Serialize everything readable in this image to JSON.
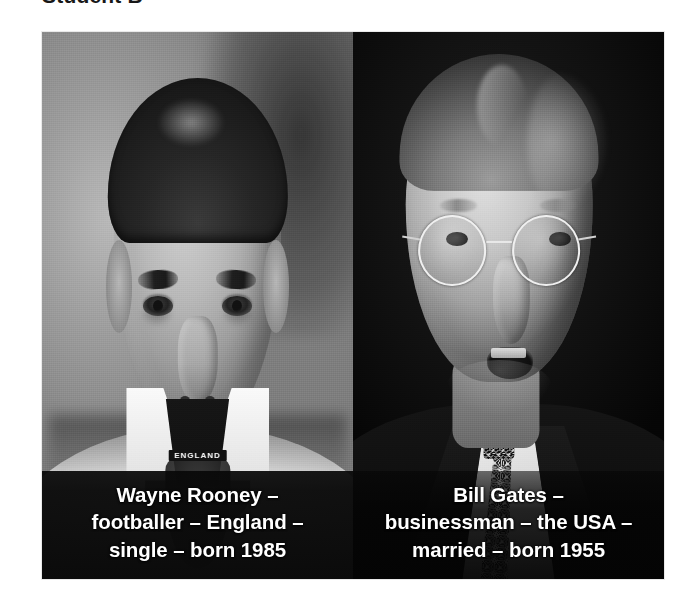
{
  "page": {
    "title": "Student B",
    "background_color": "#ffffff"
  },
  "photos": [
    {
      "id": "wayne-rooney",
      "subject": "Wayne Rooney",
      "description": "Black and white head-and-shoulders photograph of a young male footballer wearing a white England shirt with a dark collar.",
      "collar_label": "ENGLAND",
      "caption_lines": [
        "Wayne Rooney –",
        "footballer – England –",
        "single – born 1985"
      ],
      "caption_text": "Wayne Rooney – footballer – England – single – born 1985",
      "facts": {
        "name": "Wayne Rooney",
        "job": "footballer",
        "country": "England",
        "marital_status": "single",
        "born": "1985"
      },
      "caption_color": "#ffffff",
      "caption_background": "#0b0b0b",
      "photo_background": "#8f8f8f"
    },
    {
      "id": "bill-gates",
      "subject": "Bill Gates",
      "description": "Black and white photograph of a bespectacled man in a dark suit, white shirt and patterned tie, speaking against a dark background.",
      "collar_label": "",
      "caption_lines": [
        "Bill Gates –",
        "businessman – the USA –",
        "married – born 1955"
      ],
      "caption_text": "Bill Gates – businessman – the USA – married – born 1955",
      "facts": {
        "name": "Bill Gates",
        "job": "businessman",
        "country": "the USA",
        "marital_status": "married",
        "born": "1955"
      },
      "caption_color": "#ffffff",
      "caption_background": "#050505",
      "photo_background": "#050505"
    }
  ]
}
